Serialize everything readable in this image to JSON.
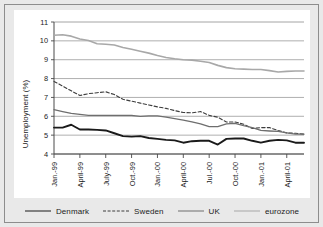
{
  "chart_data": {
    "type": "line",
    "title": "",
    "xlabel": "",
    "ylabel": "Unemployment (%)",
    "ylim": [
      4,
      11
    ],
    "ytick_step": 1,
    "yticks": [
      "4",
      "5",
      "6",
      "7",
      "8",
      "9",
      "10",
      "11"
    ],
    "grid": true,
    "grid_axis": "y",
    "legend_position": "bottom",
    "x": [
      "Jan.-99",
      "Feb.-99",
      "Mar.-99",
      "April-99",
      "May-99",
      "June-99",
      "July-99",
      "Aug.-99",
      "Sep.-99",
      "Oct.-99",
      "Nov.-99",
      "Dec.-99",
      "Jan.-00",
      "Feb.-00",
      "Mar.-00",
      "April-00",
      "May-00",
      "June-00",
      "Jul.-00",
      "Aug.-00",
      "Sep.-00",
      "Oct.-00",
      "Nov.-00",
      "Dec.-00",
      "Jan.-01",
      "Feb.-01",
      "Mar.-01",
      "April-01",
      "May-01",
      "June-01"
    ],
    "xtick_labels": [
      "Jan.-99",
      "April-99",
      "July-99",
      "Oct.-99",
      "Jan.-00",
      "April-00",
      "Jul.-00",
      "Oct.-00",
      "Jan.-01",
      "April-01"
    ],
    "xtick_indices": [
      0,
      3,
      6,
      9,
      12,
      15,
      18,
      21,
      24,
      27
    ],
    "series": [
      {
        "name": "Denmark",
        "style": "solid",
        "color": "#1a1a1a",
        "width": 1.9,
        "values": [
          5.4,
          5.4,
          5.55,
          5.3,
          5.3,
          5.28,
          5.25,
          5.1,
          4.95,
          4.92,
          4.95,
          4.85,
          4.8,
          4.75,
          4.72,
          4.6,
          4.68,
          4.7,
          4.7,
          4.5,
          4.8,
          4.82,
          4.82,
          4.7,
          4.6,
          4.7,
          4.75,
          4.72,
          4.6,
          4.6
        ]
      },
      {
        "name": "Sweden",
        "style": "dashed",
        "color": "#3d3d3d",
        "width": 1.1,
        "values": [
          7.85,
          7.6,
          7.35,
          7.1,
          7.2,
          7.25,
          7.3,
          7.15,
          6.9,
          6.8,
          6.7,
          6.6,
          6.5,
          6.42,
          6.3,
          6.2,
          6.18,
          6.25,
          6.05,
          5.95,
          5.7,
          5.7,
          5.58,
          5.35,
          5.4,
          5.4,
          5.25,
          5.12,
          5.1,
          5.05
        ]
      },
      {
        "name": "UK",
        "style": "solid",
        "color": "#6e6e6e",
        "width": 1.3,
        "values": [
          6.35,
          6.25,
          6.15,
          6.1,
          6.05,
          6.05,
          6.05,
          6.05,
          6.05,
          6.05,
          6.0,
          6.02,
          6.02,
          5.95,
          5.88,
          5.8,
          5.7,
          5.6,
          5.45,
          5.45,
          5.6,
          5.62,
          5.5,
          5.4,
          5.25,
          5.22,
          5.2,
          5.12,
          5.05,
          5.05
        ]
      },
      {
        "name": "eurozone",
        "style": "solid",
        "color": "#a8a8a8",
        "width": 1.6,
        "values": [
          10.3,
          10.32,
          10.25,
          10.1,
          10.02,
          9.85,
          9.82,
          9.78,
          9.65,
          9.55,
          9.45,
          9.35,
          9.22,
          9.12,
          9.05,
          9.0,
          8.98,
          8.92,
          8.85,
          8.7,
          8.58,
          8.52,
          8.5,
          8.48,
          8.48,
          8.42,
          8.35,
          8.38,
          8.4,
          8.4
        ]
      }
    ]
  }
}
